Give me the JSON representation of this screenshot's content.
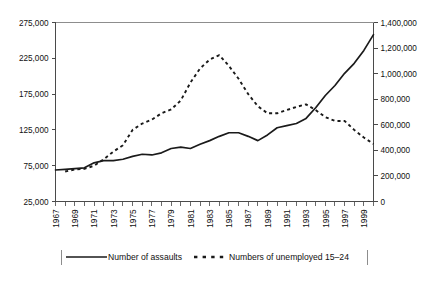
{
  "chart_data": {
    "type": "line",
    "title": "",
    "xlabel": "",
    "ylabel": "",
    "grid": false,
    "legend_position": "bottom",
    "x": [
      1967,
      1968,
      1969,
      1970,
      1971,
      1972,
      1973,
      1974,
      1975,
      1976,
      1977,
      1978,
      1979,
      1980,
      1981,
      1982,
      1983,
      1984,
      1985,
      1986,
      1987,
      1988,
      1989,
      1990,
      1991,
      1992,
      1993,
      1994,
      1995,
      1996,
      1997,
      1998,
      1999,
      2000
    ],
    "xlim": [
      1967,
      2000
    ],
    "xtick_labels": [
      "1967",
      "1969",
      "1971",
      "1973",
      "1975",
      "1977",
      "1979",
      "1981",
      "1983",
      "1985",
      "1987",
      "1989",
      "1991",
      "1993",
      "1995",
      "1997",
      "1999"
    ],
    "xtick_values": [
      1967,
      1969,
      1971,
      1973,
      1975,
      1977,
      1979,
      1981,
      1983,
      1985,
      1987,
      1989,
      1991,
      1993,
      1995,
      1997,
      1999
    ],
    "left_axis": {
      "label": "",
      "ylim": [
        25000,
        275000
      ],
      "ticks": [
        25000,
        75000,
        125000,
        175000,
        225000,
        275000
      ],
      "tick_labels": [
        "25,000",
        "75,000",
        "125,000",
        "175,000",
        "225,000",
        "275,000"
      ]
    },
    "right_axis": {
      "label": "",
      "ylim": [
        0,
        1400000
      ],
      "ticks": [
        0,
        200000,
        400000,
        600000,
        800000,
        1000000,
        1200000,
        1400000
      ],
      "tick_labels": [
        "0",
        "200,000",
        "400,000",
        "600,000",
        "800,000",
        "1,000,000",
        "1,200,000",
        "1,400,000"
      ]
    },
    "series": [
      {
        "name": "Number of assaults",
        "axis": "left",
        "style": "solid",
        "color": "#1a1a1a",
        "values": [
          69000,
          70000,
          71000,
          72000,
          79000,
          82000,
          82000,
          84000,
          88000,
          91000,
          90000,
          93000,
          99000,
          101000,
          99000,
          105000,
          110000,
          116000,
          121000,
          121000,
          116000,
          110000,
          118000,
          128000,
          131000,
          134000,
          141000,
          156000,
          173000,
          187000,
          204000,
          218000,
          236000,
          258000
        ]
      },
      {
        "name": "Numbers of unemployed 15–24",
        "axis": "right",
        "style": "dashed",
        "color": "#1a1a1a",
        "values": [
          null,
          235000,
          250000,
          255000,
          280000,
          330000,
          390000,
          440000,
          560000,
          610000,
          640000,
          690000,
          720000,
          790000,
          930000,
          1040000,
          1110000,
          1145000,
          1060000,
          960000,
          840000,
          745000,
          690000,
          690000,
          715000,
          740000,
          760000,
          715000,
          660000,
          630000,
          630000,
          560000,
          500000,
          450000
        ]
      }
    ],
    "legend": [
      {
        "label": "Number of assaults",
        "style": "solid"
      },
      {
        "label": "Numbers of unemployed 15–24",
        "style": "dashed"
      }
    ]
  }
}
